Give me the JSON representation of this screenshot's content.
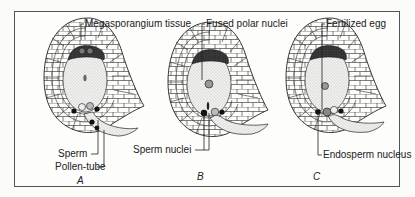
{
  "figure": {
    "panels": [
      {
        "id": "A",
        "label": "A",
        "annotations": [
          "Megasporangium tissue",
          "Sperm",
          "Pollen-tube"
        ]
      },
      {
        "id": "B",
        "label": "B",
        "annotations": [
          "Fused polar nuclei",
          "Sperm nuclei"
        ]
      },
      {
        "id": "C",
        "label": "C",
        "annotations": [
          "Fertilized egg",
          "Endosperm nucleus"
        ]
      }
    ]
  },
  "colors": {
    "line": "#2a2a2a",
    "stipple": "#c9c9c9",
    "dark": "#1e1e1e",
    "background": "#fdfdfc"
  }
}
